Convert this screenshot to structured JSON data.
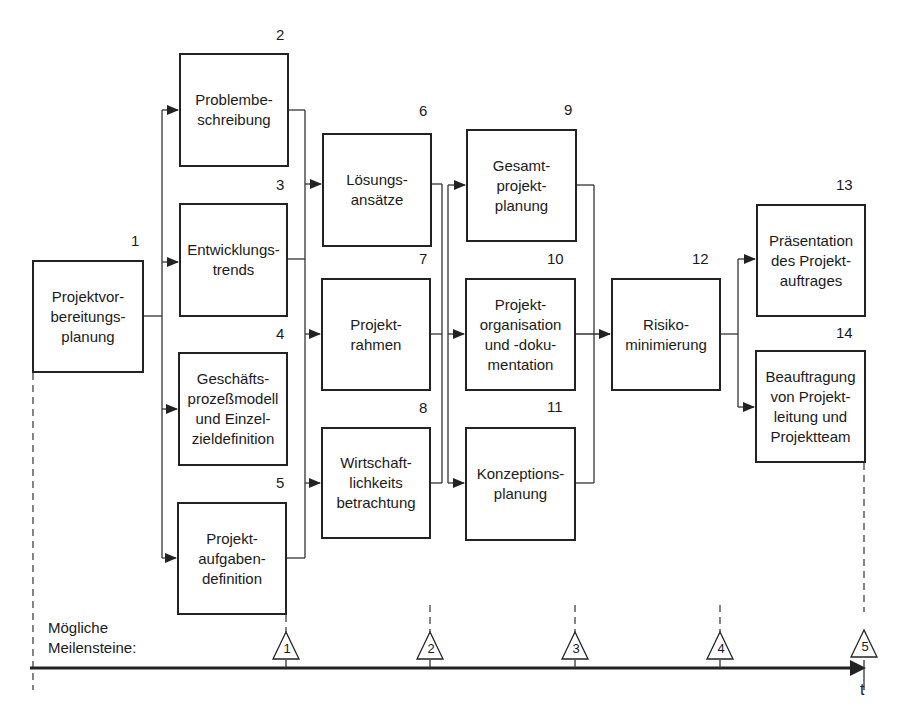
{
  "diagram": {
    "type": "project-phase-flowchart",
    "nodes": [
      {
        "id": 1,
        "number": "1",
        "label": "Projektvor-\nbereitungs-\nplanung",
        "x": 32,
        "y": 260,
        "w": 112,
        "h": 113
      },
      {
        "id": 2,
        "number": "2",
        "label": "Problembe-\nschreibung",
        "x": 179,
        "y": 53,
        "w": 110,
        "h": 114
      },
      {
        "id": 3,
        "number": "3",
        "label": "Entwicklungs-\ntrends",
        "x": 179,
        "y": 203,
        "w": 109,
        "h": 114
      },
      {
        "id": 4,
        "number": "4",
        "label": "Geschäfts-\nprozeßmodell\nund Einzel-\nzieldefinition",
        "x": 178,
        "y": 352,
        "w": 110,
        "h": 114
      },
      {
        "id": 5,
        "number": "5",
        "label": "Projekt-\naufgaben-\ndefinition",
        "x": 177,
        "y": 502,
        "w": 110,
        "h": 113
      },
      {
        "id": 6,
        "number": "6",
        "label": "Lösungs-\nansätze",
        "x": 322,
        "y": 133,
        "w": 110,
        "h": 114
      },
      {
        "id": 7,
        "number": "7",
        "label": "Projekt-\nrahmen",
        "x": 321,
        "y": 278,
        "w": 110,
        "h": 113
      },
      {
        "id": 8,
        "number": "8",
        "label": "Wirtschaft-\nlichkeits\nbetrachtung",
        "x": 321,
        "y": 427,
        "w": 110,
        "h": 112
      },
      {
        "id": 9,
        "number": "9",
        "label": "Gesamt-\nprojekt-\nplanung",
        "x": 466,
        "y": 129,
        "w": 111,
        "h": 113
      },
      {
        "id": 10,
        "number": "10",
        "label": "Projekt-\norganisation\nund -doku-\nmentation",
        "x": 465,
        "y": 278,
        "w": 111,
        "h": 113
      },
      {
        "id": 11,
        "number": "11",
        "label": "Konzeptions-\nplanung",
        "x": 465,
        "y": 427,
        "w": 111,
        "h": 114
      },
      {
        "id": 12,
        "number": "12",
        "label": "Risiko-\nminimierung",
        "x": 611,
        "y": 278,
        "w": 110,
        "h": 113
      },
      {
        "id": 13,
        "number": "13",
        "label": "Präsentation\ndes Projekt-\nauftrages",
        "x": 756,
        "y": 204,
        "w": 110,
        "h": 113
      },
      {
        "id": 14,
        "number": "14",
        "label": "Beauftragung\nvon Projekt-\nleitung und\nProjektteam",
        "x": 755,
        "y": 350,
        "w": 111,
        "h": 113
      }
    ],
    "edges": [
      {
        "from": [
          1
        ],
        "to": [
          2,
          3,
          4,
          5
        ]
      },
      {
        "from": [
          2,
          3,
          4,
          5
        ],
        "to": [
          6,
          7,
          8
        ]
      },
      {
        "from": [
          6,
          7,
          8
        ],
        "to": [
          9,
          10,
          11
        ]
      },
      {
        "from": [
          9,
          10,
          11
        ],
        "to": [
          12
        ]
      },
      {
        "from": [
          12
        ],
        "to": [
          13,
          14
        ]
      }
    ],
    "timeline": {
      "label": "Mögliche\nMeilensteine:",
      "axis_label": "t",
      "milestones": [
        {
          "number": "1",
          "x": 286
        },
        {
          "number": "2",
          "x": 430
        },
        {
          "number": "3",
          "x": 575
        },
        {
          "number": "4",
          "x": 720
        },
        {
          "number": "5",
          "x": 864
        }
      ]
    }
  }
}
